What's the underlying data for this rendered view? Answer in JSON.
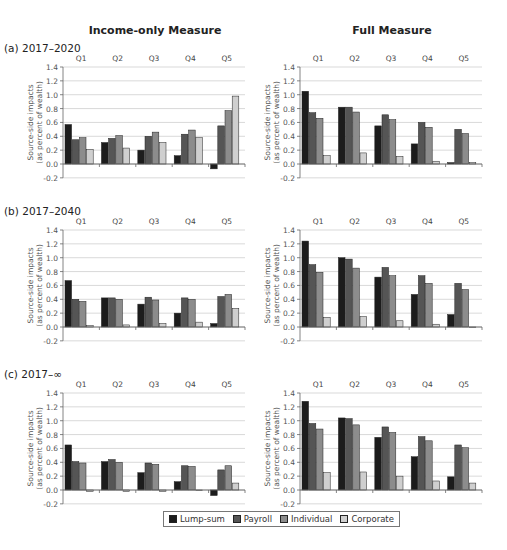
{
  "column_titles": [
    "Income-only Measure",
    "Full Measure"
  ],
  "row_titles": [
    "(a) 2017–2020",
    "(b) 2017–2040",
    "(c) 2017–∞"
  ],
  "legend": [
    {
      "label": "Lump-sum",
      "color": "#1c1c1c"
    },
    {
      "label": "Payroll",
      "color": "#555555"
    },
    {
      "label": "Individual",
      "color": "#8c8c8c"
    },
    {
      "label": "Corporate",
      "color": "#cfcfcf"
    }
  ],
  "chart_data": [
    {
      "type": "bar",
      "title": "(a) 2017–2020 — Income-only Measure",
      "categories": [
        "Q1",
        "Q2",
        "Q3",
        "Q4",
        "Q5"
      ],
      "ylabel": "Source-side impacts (as percent of wealth)",
      "yticks": [
        "1.4",
        "1.2",
        "1.0",
        "0.8",
        "0.6",
        "0.4",
        "0.2",
        "0.0",
        "-0.2"
      ],
      "ylim": [
        -0.2,
        1.4
      ],
      "grid": true,
      "series": [
        {
          "name": "Lump-sum",
          "values": [
            0.57,
            0.31,
            0.2,
            0.12,
            -0.07
          ]
        },
        {
          "name": "Payroll",
          "values": [
            0.35,
            0.37,
            0.4,
            0.43,
            0.55
          ]
        },
        {
          "name": "Individual",
          "values": [
            0.38,
            0.41,
            0.46,
            0.49,
            0.77
          ]
        },
        {
          "name": "Corporate",
          "values": [
            0.21,
            0.23,
            0.31,
            0.38,
            0.98
          ]
        }
      ]
    },
    {
      "type": "bar",
      "title": "(a) 2017–2020 — Full Measure",
      "categories": [
        "Q1",
        "Q2",
        "Q3",
        "Q4",
        "Q5"
      ],
      "ylabel": "Source-side impacts (as percent of wealth)",
      "yticks": [
        "1.4",
        "1.2",
        "1.0",
        "0.8",
        "0.6",
        "0.4",
        "0.2",
        "0.0",
        "-0.2"
      ],
      "ylim": [
        -0.2,
        1.4
      ],
      "grid": true,
      "series": [
        {
          "name": "Lump-sum",
          "values": [
            1.05,
            0.82,
            0.55,
            0.29,
            0.02
          ]
        },
        {
          "name": "Payroll",
          "values": [
            0.74,
            0.82,
            0.71,
            0.6,
            0.5
          ]
        },
        {
          "name": "Individual",
          "values": [
            0.66,
            0.75,
            0.64,
            0.53,
            0.44
          ]
        },
        {
          "name": "Corporate",
          "values": [
            0.12,
            0.16,
            0.11,
            0.04,
            0.02
          ]
        }
      ]
    },
    {
      "type": "bar",
      "title": "(b) 2017–2040 — Income-only Measure",
      "categories": [
        "Q1",
        "Q2",
        "Q3",
        "Q4",
        "Q5"
      ],
      "ylabel": "Source-side impacts (as percent of wealth)",
      "yticks": [
        "1.4",
        "1.2",
        "1.0",
        "0.8",
        "0.6",
        "0.4",
        "0.2",
        "0.0",
        "-0.2"
      ],
      "ylim": [
        -0.2,
        1.4
      ],
      "grid": true,
      "series": [
        {
          "name": "Lump-sum",
          "values": [
            0.67,
            0.42,
            0.33,
            0.2,
            0.05
          ]
        },
        {
          "name": "Payroll",
          "values": [
            0.4,
            0.42,
            0.43,
            0.42,
            0.44
          ]
        },
        {
          "name": "Individual",
          "values": [
            0.37,
            0.4,
            0.39,
            0.4,
            0.47
          ]
        },
        {
          "name": "Corporate",
          "values": [
            0.02,
            0.03,
            0.05,
            0.07,
            0.27
          ]
        }
      ]
    },
    {
      "type": "bar",
      "title": "(b) 2017–2040 — Full Measure",
      "categories": [
        "Q1",
        "Q2",
        "Q3",
        "Q4",
        "Q5"
      ],
      "ylabel": "Source-side impacts (as percent of wealth)",
      "yticks": [
        "1.4",
        "1.2",
        "1.0",
        "0.8",
        "0.6",
        "0.4",
        "0.2",
        "0.0",
        "-0.2"
      ],
      "ylim": [
        -0.2,
        1.4
      ],
      "grid": true,
      "series": [
        {
          "name": "Lump-sum",
          "values": [
            1.24,
            1.0,
            0.72,
            0.47,
            0.18
          ]
        },
        {
          "name": "Payroll",
          "values": [
            0.9,
            0.98,
            0.86,
            0.74,
            0.63
          ]
        },
        {
          "name": "Individual",
          "values": [
            0.79,
            0.85,
            0.74,
            0.63,
            0.54
          ]
        },
        {
          "name": "Corporate",
          "values": [
            0.14,
            0.15,
            0.09,
            0.04,
            -0.01
          ]
        }
      ]
    },
    {
      "type": "bar",
      "title": "(c) 2017–∞ — Income-only Measure",
      "categories": [
        "Q1",
        "Q2",
        "Q3",
        "Q4",
        "Q5"
      ],
      "ylabel": "Source-side impacts (as percent of wealth)",
      "yticks": [
        "1.4",
        "1.2",
        "1.0",
        "0.8",
        "0.6",
        "0.4",
        "0.2",
        "0.0",
        "-0.2"
      ],
      "ylim": [
        -0.2,
        1.4
      ],
      "grid": true,
      "series": [
        {
          "name": "Lump-sum",
          "values": [
            0.65,
            0.41,
            0.25,
            0.12,
            -0.08
          ]
        },
        {
          "name": "Payroll",
          "values": [
            0.41,
            0.44,
            0.39,
            0.35,
            0.29
          ]
        },
        {
          "name": "Individual",
          "values": [
            0.39,
            0.4,
            0.37,
            0.34,
            0.35
          ]
        },
        {
          "name": "Corporate",
          "values": [
            -0.02,
            -0.02,
            -0.02,
            -0.01,
            0.1
          ]
        }
      ]
    },
    {
      "type": "bar",
      "title": "(c) 2017–∞ — Full Measure",
      "categories": [
        "Q1",
        "Q2",
        "Q3",
        "Q4",
        "Q5"
      ],
      "ylabel": "Source-side impacts (as percent of wealth)",
      "yticks": [
        "1.4",
        "1.2",
        "1.0",
        "0.8",
        "0.6",
        "0.4",
        "0.2",
        "0.0",
        "-0.2"
      ],
      "ylim": [
        -0.2,
        1.4
      ],
      "grid": true,
      "series": [
        {
          "name": "Lump-sum",
          "values": [
            1.28,
            1.04,
            0.76,
            0.48,
            0.19
          ]
        },
        {
          "name": "Payroll",
          "values": [
            0.96,
            1.03,
            0.91,
            0.77,
            0.65
          ]
        },
        {
          "name": "Individual",
          "values": [
            0.88,
            0.94,
            0.83,
            0.71,
            0.61
          ]
        },
        {
          "name": "Corporate",
          "values": [
            0.25,
            0.26,
            0.2,
            0.13,
            0.1
          ]
        }
      ]
    }
  ]
}
